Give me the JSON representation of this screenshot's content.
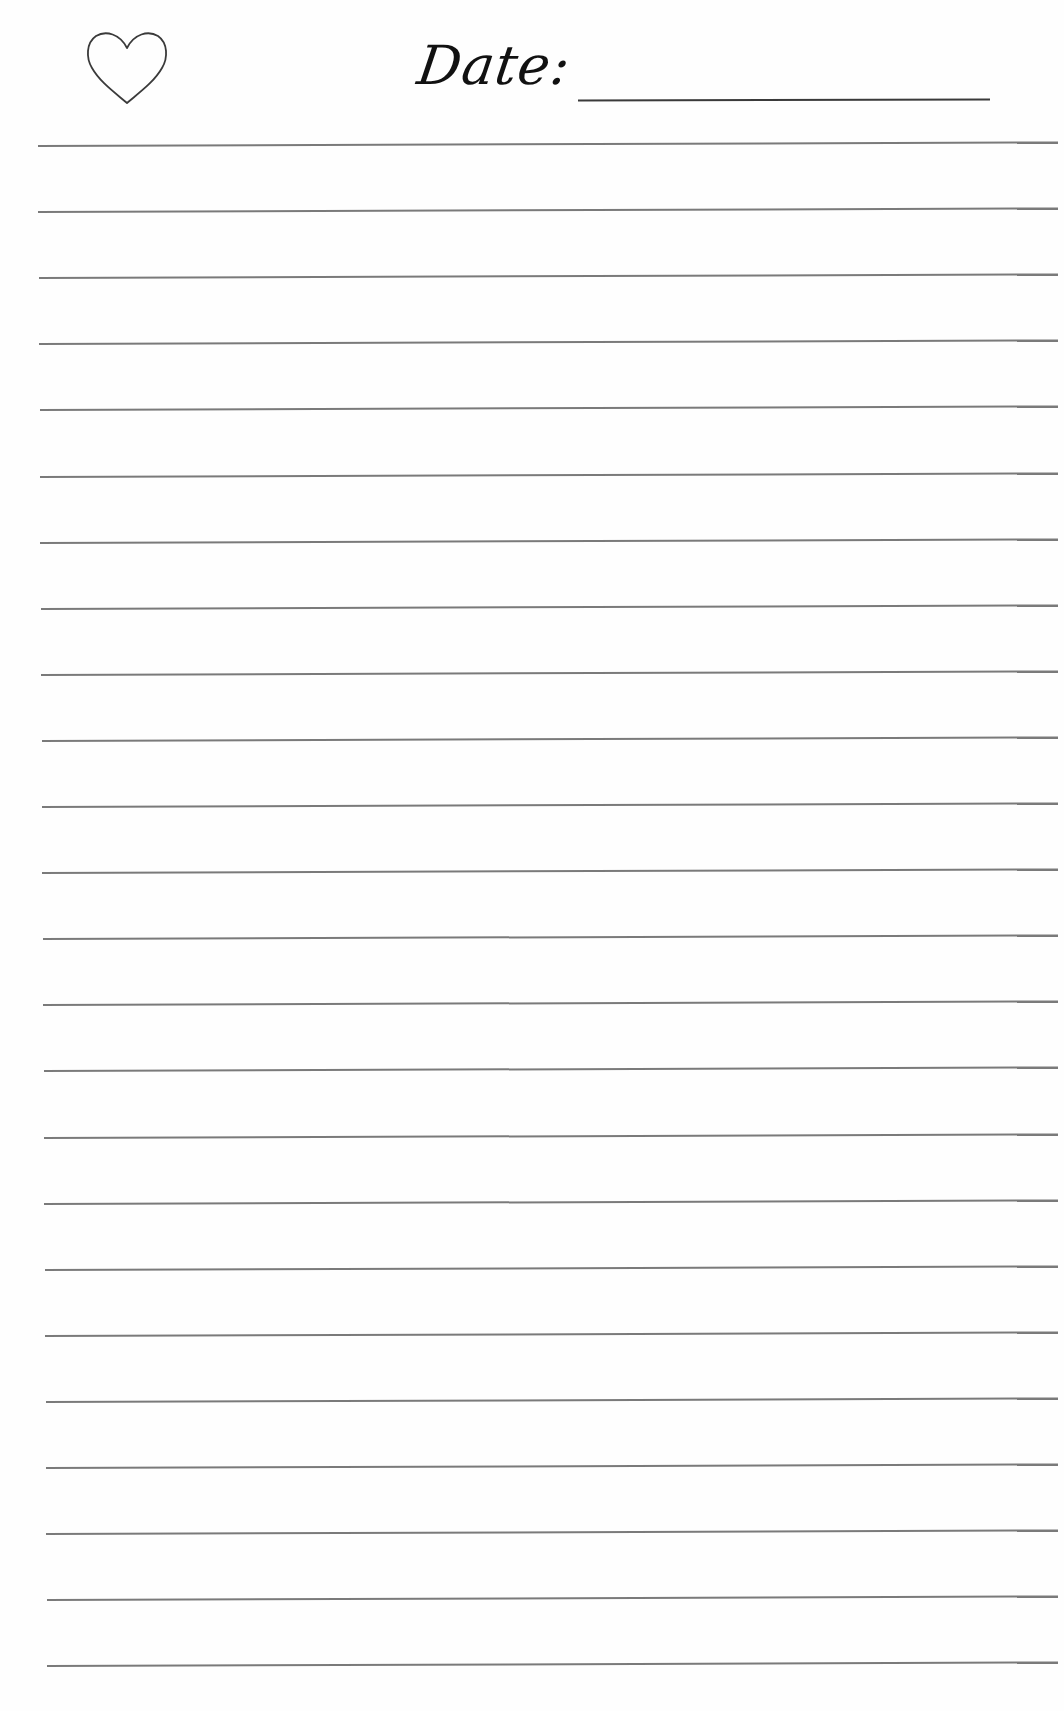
{
  "page": {
    "type": "lined-notes-page",
    "background_color": "#fefefe",
    "line_color": "#7a7a7a"
  },
  "header": {
    "icon": "heart-outline-icon",
    "date_label": "Date:",
    "date_value": ""
  },
  "ruled_lines": {
    "count": 24,
    "first_y": 145,
    "spacing": 66.1,
    "left_x": 38,
    "right_x": 1058
  }
}
